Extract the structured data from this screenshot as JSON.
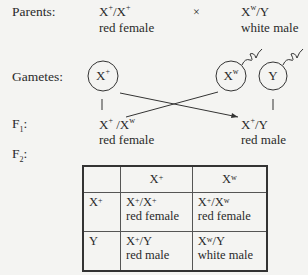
{
  "labels": {
    "parents": "Parents:",
    "gametes": "Gametes:",
    "f1": "F",
    "f1_sub": "1",
    "f2": "F",
    "f2_sub": "2",
    "f_suffix": ":"
  },
  "parents": {
    "female": {
      "genotype_a": "X",
      "sup_a": "+",
      "sep": "/",
      "genotype_b": "X",
      "sup_b": "+",
      "phenotype": "red female"
    },
    "cross_symbol": "×",
    "male": {
      "genotype_a": "X",
      "sup_a": "w",
      "sep": "/",
      "genotype_b": "Y",
      "phenotype": "white male"
    }
  },
  "gametes": [
    {
      "base": "X",
      "sup": "+"
    },
    {
      "base": "X",
      "sup": "w"
    },
    {
      "base": "Y",
      "sup": ""
    }
  ],
  "f1": [
    {
      "genotype_a": "X",
      "sup_a": "+",
      "sep": " /",
      "genotype_b": "X",
      "sup_b": "w",
      "phenotype": "red female"
    },
    {
      "genotype_a": "X",
      "sup_a": "+",
      "sep": "/",
      "genotype_b": "Y",
      "sup_b": "",
      "phenotype": "red male"
    }
  ],
  "punnett": {
    "col_headers": [
      {
        "base": "X",
        "sup": "+"
      },
      {
        "base": "X",
        "sup": "w"
      }
    ],
    "row_headers": [
      {
        "base": "X",
        "sup": "+"
      },
      {
        "base": "Y",
        "sup": ""
      }
    ],
    "cells": [
      [
        {
          "a": "X",
          "sa": "+",
          "b": "/X",
          "sb": "+",
          "phenotype": "red female"
        },
        {
          "a": "X",
          "sa": "+",
          "b": "/X",
          "sb": "w",
          "phenotype": "red female"
        }
      ],
      [
        {
          "a": "X",
          "sa": "+",
          "b": "/Y",
          "sb": "",
          "phenotype": "red male"
        },
        {
          "a": "X",
          "sa": "w",
          "b": "/Y",
          "sb": "",
          "phenotype": "white male"
        }
      ]
    ]
  }
}
